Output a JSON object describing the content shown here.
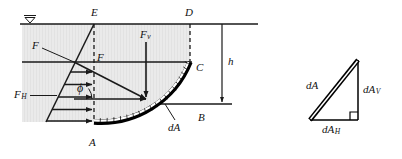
{
  "figure": {
    "colors": {
      "water_fill": "#e9e9e9",
      "line": "#1a1a1a",
      "surface_band_fill": "#ffffff",
      "surface_band_stroke": "#000000",
      "background": "#ffffff"
    }
  },
  "labels": {
    "water_surface_symbol": "water-surface-level-symbol",
    "point_E": "E",
    "point_D": "D",
    "point_C": "C",
    "point_B": "B",
    "point_A": "A",
    "point_F": "F",
    "force_resultant": "F",
    "force_vertical_main": "F",
    "force_vertical_sub": "v",
    "force_horizontal_main": "F",
    "force_horizontal_sub": "H",
    "angle_phi": "ϕ",
    "depth_h": "h",
    "area_element": "dA"
  },
  "detail_triangle": {
    "hypotenuse_label": "dA",
    "vertical_main": "dA",
    "vertical_sub": "V",
    "horizontal_main": "dA",
    "horizontal_sub": "H",
    "right_angle_marker": "right-angle-marker"
  }
}
